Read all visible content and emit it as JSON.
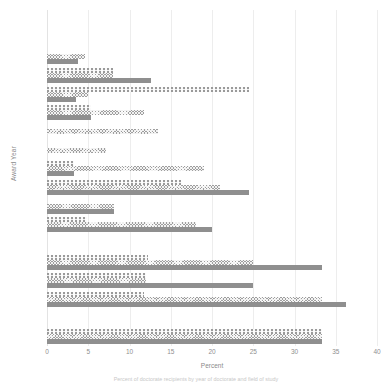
{
  "chart_data": {
    "type": "bar",
    "orientation": "horizontal",
    "title": "",
    "xlabel": "Percent",
    "ylabel": "Award Year",
    "xlim": [
      0,
      40
    ],
    "xticks": [
      0,
      5,
      10,
      15,
      20,
      25,
      30,
      35,
      40
    ],
    "grid": "vertical",
    "legend": "none",
    "categories": [
      "2009",
      "2008",
      "2007",
      "2006",
      "2005",
      "2004",
      "2003",
      "2002",
      "2001",
      "2000",
      "1999",
      "1998",
      "1997",
      "1996",
      "1995",
      "1994",
      "1993",
      "1992"
    ],
    "series": [
      {
        "name": "series-1",
        "pattern": "square-dotted",
        "values": [
          0,
          0,
          0,
          8.0,
          24.5,
          5.3,
          0,
          0,
          3.3,
          16.3,
          0,
          4.9,
          0,
          12.3,
          12.0,
          11.8,
          0,
          33.3
        ]
      },
      {
        "name": "series-2",
        "pattern": "cross-hatch",
        "values": [
          0,
          0,
          4.6,
          8.0,
          5.0,
          11.7,
          13.5,
          7.2,
          19.0,
          21.0,
          8.1,
          18.0,
          0,
          25.0,
          12.0,
          33.3,
          0,
          33.3
        ]
      },
      {
        "name": "series-3",
        "pattern": "solid",
        "values": [
          0,
          0,
          3.7,
          12.6,
          3.5,
          5.3,
          0,
          0,
          3.3,
          24.5,
          8.1,
          20.0,
          0,
          33.3,
          25.0,
          36.3,
          0,
          33.3
        ]
      }
    ]
  },
  "caption": {
    "text": "Percent of doctorate recipients by year of doctorate and field of study"
  }
}
